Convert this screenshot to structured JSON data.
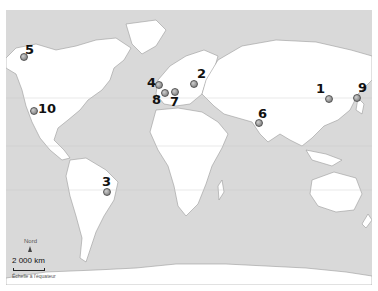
{
  "map": {
    "colors": {
      "ocean": "#d9d9d9",
      "land": "#ffffff",
      "border": "#9a9a9a",
      "marker": "#777777"
    },
    "markers": [
      {
        "id": "1",
        "label": "1",
        "x": 328,
        "y": 98,
        "lx": 316,
        "ly": 82
      },
      {
        "id": "2",
        "label": "2",
        "x": 193,
        "y": 83,
        "lx": 197,
        "ly": 67
      },
      {
        "id": "3",
        "label": "3",
        "x": 106,
        "y": 191,
        "lx": 102,
        "ly": 175
      },
      {
        "id": "4",
        "label": "4",
        "x": 158,
        "y": 84,
        "lx": 147,
        "ly": 76
      },
      {
        "id": "5",
        "label": "5",
        "x": 23,
        "y": 56,
        "lx": 25,
        "ly": 43
      },
      {
        "id": "6",
        "label": "6",
        "x": 258,
        "y": 122,
        "lx": 258,
        "ly": 107
      },
      {
        "id": "7",
        "label": "7",
        "x": 174,
        "y": 91,
        "lx": 170,
        "ly": 95
      },
      {
        "id": "8",
        "label": "8",
        "x": 164,
        "y": 92,
        "lx": 152,
        "ly": 93
      },
      {
        "id": "9",
        "label": "9",
        "x": 356,
        "y": 97,
        "lx": 358,
        "ly": 81
      },
      {
        "id": "10",
        "label": "10",
        "x": 33,
        "y": 110,
        "lx": 38,
        "ly": 102
      }
    ]
  },
  "legend": {
    "north_label": "Nord",
    "scale_label": "2 000 km",
    "scale_caption": "Échelle à l'équateur"
  }
}
